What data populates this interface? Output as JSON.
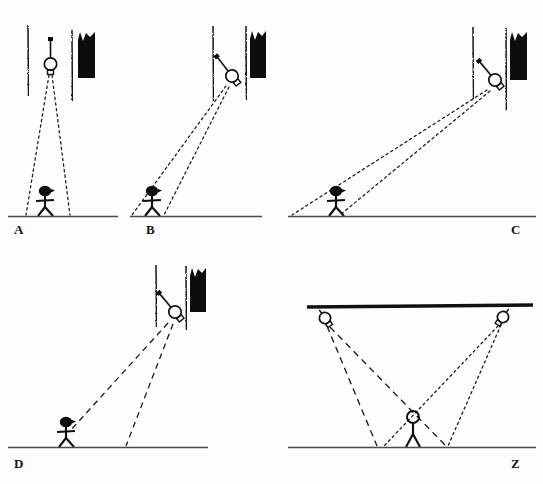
{
  "figure": {
    "background_color": "#fdfdfd",
    "ink_color": "#111111",
    "ground_color": "#555555",
    "panel_labels": [
      "A",
      "B",
      "C",
      "D",
      "Z"
    ],
    "faint_header_marks": "· · · ·"
  },
  "panels": [
    {
      "id": "A",
      "label": "A",
      "label_x": 14,
      "label_y": 222,
      "description": "Observer directly below lamp; two dotted rays fan down symmetrically to the ground",
      "ground": {
        "x1": 8,
        "y1": 216,
        "x2": 118,
        "y2": 216
      },
      "lamp": {
        "x": 50,
        "y": 66,
        "rotation": 0,
        "style": "upright"
      },
      "wall_left": {
        "x": 28,
        "y_top": 26,
        "y_bottom": 96
      },
      "wall_right": {
        "x": 72,
        "y_top": 30,
        "y_bottom": 100
      },
      "dark_block": {
        "x": 78,
        "y": 32,
        "w": 17,
        "h": 46
      },
      "figure": {
        "x": 47,
        "y_ground": 216,
        "height": 38,
        "facing": "right"
      },
      "rays": [
        {
          "style": "dotted",
          "x1": 50,
          "y1": 74,
          "x2": 26,
          "y2": 215
        },
        {
          "style": "dotted",
          "x1": 52,
          "y1": 74,
          "x2": 70,
          "y2": 215
        }
      ]
    },
    {
      "id": "B",
      "label": "B",
      "label_x": 146,
      "label_y": 222,
      "description": "Observer offset left of a tilted lamp; two long dotted rays angle down-left to the ground",
      "ground": {
        "x1": 130,
        "y1": 216,
        "x2": 262,
        "y2": 216
      },
      "lamp": {
        "x": 232,
        "y": 76,
        "rotation": -38,
        "style": "tilted"
      },
      "wall_left": {
        "x": 213,
        "y_top": 26,
        "y_bottom": 102
      },
      "wall_right": {
        "x": 246,
        "y_top": 26,
        "y_bottom": 100
      },
      "dark_block": {
        "x": 250,
        "y": 31,
        "w": 16,
        "h": 47
      },
      "figure": {
        "x": 154,
        "y_ground": 216,
        "height": 38,
        "facing": "right"
      },
      "rays": [
        {
          "style": "dotted",
          "x1": 228,
          "y1": 84,
          "x2": 132,
          "y2": 215
        },
        {
          "style": "dotted",
          "x1": 231,
          "y1": 84,
          "x2": 164,
          "y2": 215
        }
      ]
    },
    {
      "id": "C",
      "label": "C",
      "label_x": 511,
      "label_y": 222,
      "description": "Observer far left of a tilted lamp; two very long shallow dotted rays reach the ground",
      "ground": {
        "x1": 288,
        "y1": 216,
        "x2": 536,
        "y2": 216
      },
      "lamp": {
        "x": 495,
        "y": 80,
        "rotation": -40,
        "style": "tilted"
      },
      "wall_left": {
        "x": 473,
        "y_top": 27,
        "y_bottom": 100
      },
      "wall_right": {
        "x": 506,
        "y_top": 28,
        "y_bottom": 110
      },
      "dark_block": {
        "x": 510,
        "y": 32,
        "w": 17,
        "h": 48
      },
      "figure": {
        "x": 320,
        "y_ground": 216,
        "height": 38,
        "facing": "right"
      },
      "rays": [
        {
          "style": "dotted",
          "x1": 489,
          "y1": 87,
          "x2": 292,
          "y2": 215
        },
        {
          "style": "dotted",
          "x1": 492,
          "y1": 88,
          "x2": 340,
          "y2": 215
        }
      ]
    },
    {
      "id": "D",
      "label": "D",
      "label_x": 14,
      "label_y": 464,
      "description": "Observer left of a tilted lamp; two long dashed rays, one to the observer and one past to the ground",
      "ground": {
        "x1": 8,
        "y1": 447,
        "x2": 208,
        "y2": 447
      },
      "lamp": {
        "x": 175,
        "y": 312,
        "rotation": -40,
        "style": "tilted"
      },
      "wall_left": {
        "x": 156,
        "y_top": 265,
        "y_bottom": 327
      },
      "wall_right": {
        "x": 186,
        "y_top": 266,
        "y_bottom": 330
      },
      "dark_block": {
        "x": 190,
        "y": 268,
        "w": 16,
        "h": 44
      },
      "figure": {
        "x": 70,
        "y_ground": 447,
        "height": 38,
        "facing": "right"
      },
      "rays": [
        {
          "style": "dashed",
          "x1": 170,
          "y1": 322,
          "x2": 70,
          "y2": 430
        },
        {
          "style": "dashed",
          "x1": 174,
          "y1": 322,
          "x2": 126,
          "y2": 446
        }
      ]
    },
    {
      "id": "Z",
      "label": "Z",
      "label_x": 511,
      "label_y": 464,
      "description": "Two ceiling-mounted lamps cast crossing dashed and dotted ray pairs around a central observer",
      "ground": {
        "x1": 288,
        "y1": 447,
        "x2": 536,
        "y2": 447
      },
      "ceiling": {
        "x1": 307,
        "y1": 307,
        "x2": 533,
        "y2": 305
      },
      "lamp_left": {
        "x": 325,
        "y": 318,
        "rotation": -35,
        "style": "tilted"
      },
      "lamp_right": {
        "x": 503,
        "y": 317,
        "rotation": 35,
        "style": "tilted-mirror"
      },
      "figure": {
        "x": 412,
        "y_ground": 447,
        "height": 36,
        "facing": "front"
      },
      "rays": [
        {
          "style": "dashed",
          "x1": 329,
          "y1": 325,
          "x2": 377,
          "y2": 446
        },
        {
          "style": "dashed",
          "x1": 331,
          "y1": 326,
          "x2": 446,
          "y2": 446
        },
        {
          "style": "dotted",
          "x1": 500,
          "y1": 325,
          "x2": 448,
          "y2": 446
        },
        {
          "style": "dotted",
          "x1": 498,
          "y1": 326,
          "x2": 384,
          "y2": 446
        }
      ]
    }
  ],
  "legend_semantics": {
    "dotted_ray": "dotted light ray",
    "dashed_ray": "dashed light ray",
    "lamp": "hanging lamp with bulb and stem",
    "dark_block": "dark curtain / shadow block",
    "wall": "wavy hand-drawn vertical wall edge",
    "ground": "horizontal ground line",
    "observer": "stick figure observer"
  }
}
